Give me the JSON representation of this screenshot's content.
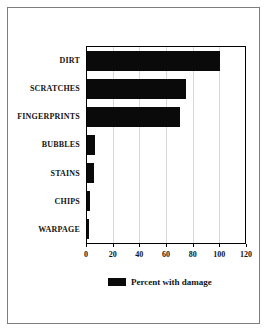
{
  "chart_data": {
    "type": "bar",
    "orientation": "horizontal",
    "title": "",
    "xlabel": "",
    "ylabel": "",
    "categories": [
      "DIRT",
      "SCRATCHES",
      "FINGERPRINTS",
      "BUBBLES",
      "STAINS",
      "CHIPS",
      "WARPAGE"
    ],
    "values": [
      100,
      74,
      70,
      6,
      5,
      2,
      1.5
    ],
    "xlim": [
      0,
      120
    ],
    "xticks": [
      0,
      20,
      40,
      60,
      80,
      100,
      120
    ],
    "grid": "vertical gridlines at x ticks",
    "legend": {
      "label": "Percent with damage",
      "position": "bottom-center"
    }
  },
  "colors": {
    "bar": "#0a0a0a",
    "plot_border": "#000000",
    "frame_border": "#7d7d7d",
    "gridline": "#d8d8d8",
    "background": "#ffffff",
    "text": "#141414"
  }
}
